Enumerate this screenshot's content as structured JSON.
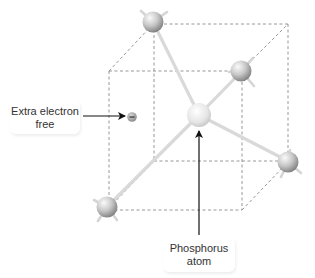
{
  "diagram": {
    "labels": {
      "electron": {
        "line1": "Extra electron",
        "line2": "free"
      },
      "phosphorus": {
        "line1": "Phosphorus",
        "line2": "atom"
      }
    },
    "nodes": [
      {
        "id": "phosphorus-center",
        "x": 199,
        "y": 115,
        "r": 12,
        "type": "phosphorus"
      },
      {
        "id": "silicon-top",
        "x": 153,
        "y": 22,
        "r": 11,
        "type": "silicon"
      },
      {
        "id": "silicon-upper-right",
        "x": 241,
        "y": 71,
        "r": 11,
        "type": "silicon"
      },
      {
        "id": "silicon-lower-right",
        "x": 288,
        "y": 162,
        "r": 11,
        "type": "silicon"
      },
      {
        "id": "silicon-bottom-left",
        "x": 107,
        "y": 207,
        "r": 11,
        "type": "silicon"
      },
      {
        "id": "free-electron",
        "x": 132,
        "y": 117,
        "r": 4.5,
        "type": "electron",
        "symbol": "−"
      }
    ],
    "colors": {
      "atom_light": "#f2f2f2",
      "atom_dark": "#8a8a8a",
      "bond": "#dcdcdc",
      "cube_lines": "#8c8c8c",
      "arrow": "#111111",
      "text": "#333333"
    }
  }
}
